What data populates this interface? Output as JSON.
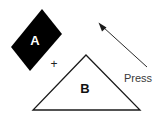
{
  "figure": {
    "background_color": "#ffffff",
    "shapes": {
      "parallelogram": {
        "label": "A",
        "fill_color": "#000000",
        "label_color": "#ffffff",
        "points": "42,9 62,34 30,71 11,47",
        "label_x": 35,
        "label_y": 45
      },
      "triangle": {
        "label": "B",
        "fill_color": "#ffffff",
        "stroke_color": "#1a1a1a",
        "label_color": "#111111",
        "points": "86,55 140,110 33,110",
        "label_x": 85,
        "label_y": 93
      }
    },
    "plus": {
      "symbol": "+",
      "x": 54,
      "y": 68
    },
    "arrow": {
      "label": "Press",
      "stroke_color": "#2b2b2b",
      "tail_x": 147,
      "tail_y": 67,
      "head_x": 99,
      "head_y": 23,
      "label_x": 124,
      "label_y": 82
    }
  }
}
